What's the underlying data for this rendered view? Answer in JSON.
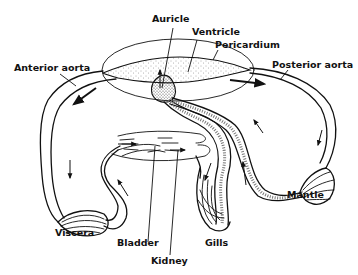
{
  "diagram": {
    "labels": {
      "auricle": "Auricle",
      "ventricle": "Ventricle",
      "pericardium": "Pericardium",
      "anterior_aorta": "Anterior aorta",
      "posterior_aorta": "Posterior aorta",
      "viscera": "Viscera",
      "bladder": "Bladder",
      "kidney": "Kidney",
      "gills": "Gills",
      "mantle": "Mantle"
    },
    "colors": {
      "ink": "#111111",
      "background": "#ffffff",
      "stipple": "#555555"
    }
  }
}
